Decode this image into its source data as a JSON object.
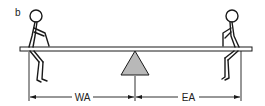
{
  "panel_label": "b",
  "dimensions": {
    "left_label": "WA",
    "right_label": "EA"
  },
  "elements": {
    "beam": "seesaw-beam",
    "fulcrum": "triangle-fulcrum",
    "left_person": "seated-stick-figure-left",
    "right_person": "seated-stick-figure-right"
  },
  "colors": {
    "line": "#1a1a1a",
    "fulcrum_fill": "#b8b8b8",
    "background": "#ffffff"
  }
}
